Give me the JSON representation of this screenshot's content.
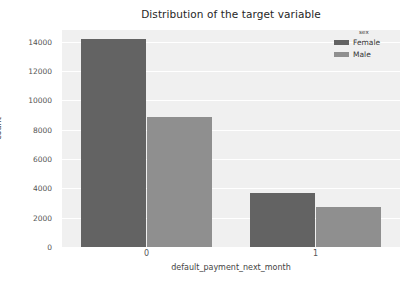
{
  "chart_data": {
    "type": "bar",
    "title": "Distribution of the target variable",
    "xlabel": "default_payment_next_month",
    "ylabel": "count",
    "categories": [
      "0",
      "1"
    ],
    "series": [
      {
        "name": "Female",
        "color": "#636363",
        "values": [
          14200,
          3650
        ]
      },
      {
        "name": "Male",
        "color": "#8f8f8f",
        "values": [
          8900,
          2750
        ]
      }
    ],
    "legend": {
      "title": "sex",
      "position": "upper-right-outside",
      "entries": [
        {
          "label": "Female",
          "color": "#636363"
        },
        {
          "label": "Male",
          "color": "#8f8f8f"
        }
      ]
    },
    "yticks": [
      "0",
      "2000",
      "4000",
      "6000",
      "8000",
      "10000",
      "12000",
      "14000"
    ],
    "ytick_values": [
      0,
      2000,
      4000,
      6000,
      8000,
      10000,
      12000,
      14000
    ],
    "xticks": [
      "0",
      "1"
    ],
    "ylim": [
      0,
      14800
    ],
    "grid": true,
    "grid_color": "#ffffff",
    "plot_background": "#f0f0f0",
    "figure_background": "#ffffff"
  }
}
